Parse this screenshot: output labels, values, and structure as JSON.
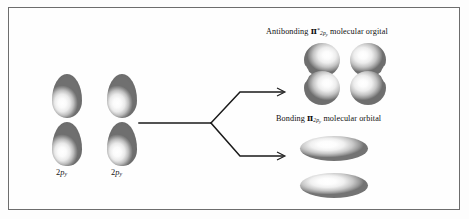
{
  "figure": {
    "type": "molecular-orbital-diagram",
    "background_color": "#fdfdfd",
    "border_color": "#6d6d6d",
    "orbital_shading": "grayscale-3d"
  },
  "atomic_orbitals": {
    "left": {
      "label_prefix": "2",
      "label_p": "p",
      "label_sub": "y",
      "shape": "dumbbell"
    },
    "right": {
      "label_prefix": "2",
      "label_p": "p",
      "label_sub": "y",
      "shape": "dumbbell"
    }
  },
  "molecular_orbitals": {
    "antibonding": {
      "prefix": "Antibonding ",
      "symbol": "π",
      "star": "*",
      "sub_main": "2p",
      "sub_minor": "y",
      "suffix": " molecular orgital",
      "shape": "two-facing-kidney-lobes"
    },
    "bonding": {
      "prefix": "Bonding ",
      "symbol": "π",
      "star": "",
      "sub_main": "2p",
      "sub_minor": "y",
      "suffix": " molecular orbital",
      "shape": "two-stacked-flat-lobes"
    }
  },
  "arrows": {
    "stem_label": "combination",
    "branch_up_label": "antibonding-branch",
    "branch_down_label": "bonding-branch"
  }
}
